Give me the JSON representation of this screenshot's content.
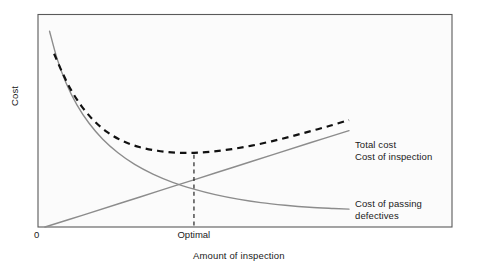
{
  "chart_data": {
    "type": "line",
    "title": "",
    "subtitle": "",
    "xlabel": "Amount of inspection",
    "ylabel": "Cost",
    "xlim": [
      0,
      1
    ],
    "ylim": [
      0,
      1
    ],
    "grid": false,
    "legend_position": "right-inline",
    "x_tick_labels": [
      "0",
      "Optimal"
    ],
    "y_tick_labels": [],
    "annotations": [
      {
        "name": "optimal-dashed-guide",
        "text": "",
        "x": "Optimal",
        "description": "vertical dashed guide line from minimum of total cost curve down to x-axis at the optimal inspection amount"
      }
    ],
    "series": [
      {
        "name": "Total cost",
        "style": "dashed",
        "color": "#111111",
        "points": [
          [
            0.03,
            0.845
          ],
          [
            0.055,
            0.76
          ],
          [
            0.085,
            0.67
          ],
          [
            0.12,
            0.59
          ],
          [
            0.16,
            0.52
          ],
          [
            0.205,
            0.463
          ],
          [
            0.255,
            0.42
          ],
          [
            0.31,
            0.39
          ],
          [
            0.37,
            0.372
          ],
          [
            0.43,
            0.363
          ],
          [
            0.49,
            0.362
          ],
          [
            0.55,
            0.368
          ],
          [
            0.615,
            0.38
          ],
          [
            0.68,
            0.397
          ],
          [
            0.745,
            0.418
          ],
          [
            0.81,
            0.442
          ],
          [
            0.875,
            0.468
          ],
          [
            0.94,
            0.495
          ],
          [
            1.0,
            0.522
          ]
        ]
      },
      {
        "name": "Cost of inspection",
        "style": "solid",
        "color": "#8c8c8c",
        "points": [
          [
            0.0,
            0.0
          ],
          [
            0.125,
            0.058
          ],
          [
            0.25,
            0.117
          ],
          [
            0.375,
            0.176
          ],
          [
            0.5,
            0.235
          ],
          [
            0.625,
            0.294
          ],
          [
            0.75,
            0.353
          ],
          [
            0.875,
            0.412
          ],
          [
            1.0,
            0.47
          ]
        ]
      },
      {
        "name": "Cost of passing defectives",
        "style": "solid",
        "color": "#8c8c8c",
        "points": [
          [
            0.015,
            0.955
          ],
          [
            0.04,
            0.82
          ],
          [
            0.07,
            0.7
          ],
          [
            0.105,
            0.596
          ],
          [
            0.145,
            0.506
          ],
          [
            0.19,
            0.428
          ],
          [
            0.24,
            0.362
          ],
          [
            0.295,
            0.305
          ],
          [
            0.355,
            0.258
          ],
          [
            0.42,
            0.218
          ],
          [
            0.49,
            0.185
          ],
          [
            0.56,
            0.158
          ],
          [
            0.635,
            0.136
          ],
          [
            0.71,
            0.119
          ],
          [
            0.79,
            0.106
          ],
          [
            0.87,
            0.096
          ],
          [
            0.95,
            0.09
          ],
          [
            1.0,
            0.087
          ]
        ]
      }
    ]
  },
  "labels": {
    "y_axis": "Cost",
    "x_axis": "Amount of inspection",
    "origin_tick": "0",
    "optimal_tick": "Optimal",
    "total_cost": "Total cost",
    "cost_of_inspection": "Cost of inspection",
    "cost_of_passing_defectives": "Cost of passing defectives"
  },
  "colors": {
    "background": "#ffffff",
    "frame": "#5a5a5a",
    "solid_curve": "#8c8c8c",
    "dashed_curve": "#111111",
    "text": "#1a1a1a"
  }
}
